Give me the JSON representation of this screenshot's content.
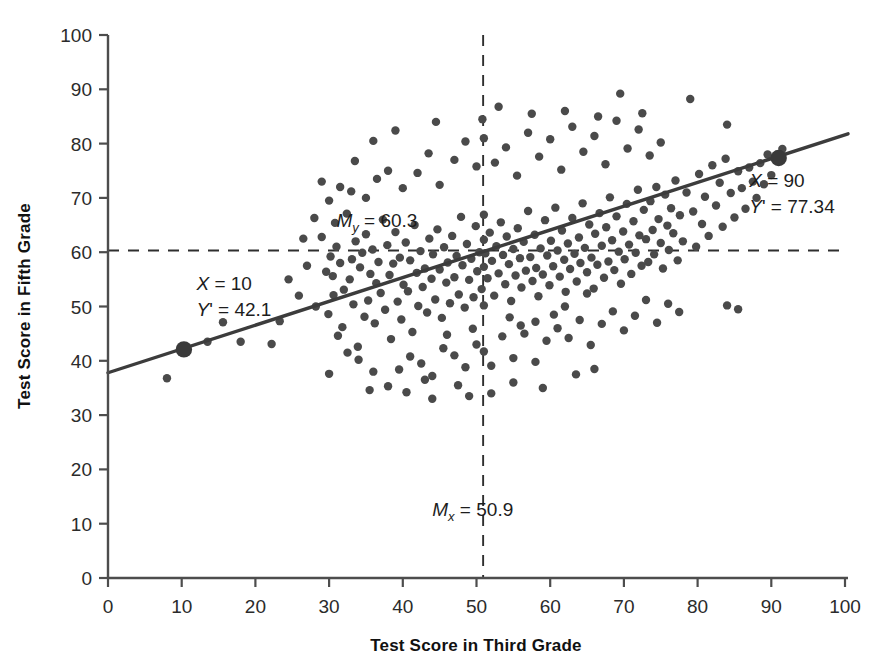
{
  "chart_data": {
    "type": "scatter",
    "title": "",
    "xlabel": "Test Score in Third Grade",
    "ylabel": "Test Score in Fifth Grade",
    "xlim": [
      0,
      100
    ],
    "ylim": [
      0,
      100
    ],
    "xticks": [
      "0",
      "10",
      "20",
      "30",
      "40",
      "50",
      "60",
      "70",
      "80",
      "90",
      "100"
    ],
    "yticks": [
      "0",
      "10",
      "20",
      "30",
      "40",
      "50",
      "60",
      "70",
      "80",
      "90",
      "100"
    ],
    "grid": false,
    "legend": "none",
    "point_color": "#4a4a4a",
    "line_color": "#3c3c3c",
    "axis_color": "#4d4d4d",
    "mean_x": 50.9,
    "mean_y": 60.3,
    "regression": {
      "x0": 0,
      "y0": 37.8,
      "x1": 100,
      "y1": 81.8,
      "slope": 0.44,
      "intercept": 37.8
    },
    "annotations": [
      {
        "name": "mean-y-label",
        "line1": "M",
        "sub": "y",
        "line1_rest": " = 60.3",
        "x": 31,
        "y": 64.6
      },
      {
        "name": "mean-x-label",
        "line1": "M",
        "sub": "x",
        "line1_rest": " = 50.9",
        "x": 44,
        "y": 11.5
      },
      {
        "name": "left-point-label",
        "line1": "X = 10",
        "line2": "Y' = 42.1",
        "x": 12,
        "y": 53
      },
      {
        "name": "right-point-label",
        "line1": "X = 90",
        "line2": "Y' = 77.34",
        "x": 87,
        "y": 72
      }
    ],
    "highlighted_points": [
      {
        "name": "point-x10",
        "x": 10.3,
        "y": 42.1,
        "label_x": "X = 10",
        "label_y": "Y' = 42.1"
      },
      {
        "name": "point-x90",
        "x": 91.0,
        "y": 77.34,
        "label_x": "X = 90",
        "label_y": "Y' = 77.34"
      }
    ],
    "points": [
      [
        8.0,
        36.8
      ],
      [
        10.3,
        42.1
      ],
      [
        13.5,
        43.5
      ],
      [
        15.6,
        47.1
      ],
      [
        18.0,
        43.5
      ],
      [
        22.2,
        43.1
      ],
      [
        23.3,
        47.3
      ],
      [
        24.5,
        55.0
      ],
      [
        25.9,
        52.0
      ],
      [
        27.0,
        57.5
      ],
      [
        28.2,
        50.0
      ],
      [
        29.0,
        62.8
      ],
      [
        29.6,
        56.4
      ],
      [
        29.9,
        48.6
      ],
      [
        30.2,
        59.2
      ],
      [
        30.5,
        55.6
      ],
      [
        30.6,
        52.1
      ],
      [
        30.8,
        65.4
      ],
      [
        31.0,
        61.0
      ],
      [
        31.2,
        44.6
      ],
      [
        31.5,
        58.0
      ],
      [
        31.8,
        46.2
      ],
      [
        32.0,
        53.1
      ],
      [
        32.4,
        67.1
      ],
      [
        32.8,
        55.0
      ],
      [
        33.1,
        58.7
      ],
      [
        33.3,
        50.4
      ],
      [
        33.6,
        62.0
      ],
      [
        33.9,
        42.6
      ],
      [
        34.2,
        57.2
      ],
      [
        34.5,
        59.9
      ],
      [
        34.8,
        48.1
      ],
      [
        35.0,
        63.3
      ],
      [
        35.3,
        51.1
      ],
      [
        35.6,
        56.0
      ],
      [
        35.9,
        60.5
      ],
      [
        36.2,
        46.9
      ],
      [
        36.4,
        54.3
      ],
      [
        36.7,
        58.2
      ],
      [
        37.0,
        52.5
      ],
      [
        37.3,
        66.0
      ],
      [
        37.6,
        49.4
      ],
      [
        37.9,
        61.3
      ],
      [
        38.2,
        55.8
      ],
      [
        38.4,
        44.0
      ],
      [
        38.7,
        57.9
      ],
      [
        39.0,
        63.7
      ],
      [
        39.3,
        50.9
      ],
      [
        39.6,
        59.0
      ],
      [
        39.8,
        47.6
      ],
      [
        40.1,
        54.0
      ],
      [
        40.4,
        61.8
      ],
      [
        40.7,
        52.8
      ],
      [
        41.0,
        58.5
      ],
      [
        41.3,
        45.3
      ],
      [
        41.6,
        65.0
      ],
      [
        41.9,
        56.2
      ],
      [
        42.1,
        50.1
      ],
      [
        42.4,
        60.2
      ],
      [
        42.7,
        53.6
      ],
      [
        43.0,
        57.0
      ],
      [
        43.3,
        48.9
      ],
      [
        43.6,
        62.5
      ],
      [
        43.9,
        55.1
      ],
      [
        44.1,
        59.6
      ],
      [
        44.4,
        51.3
      ],
      [
        44.7,
        64.2
      ],
      [
        45.0,
        56.8
      ],
      [
        45.3,
        47.9
      ],
      [
        45.6,
        60.9
      ],
      [
        45.9,
        54.4
      ],
      [
        46.1,
        58.1
      ],
      [
        46.4,
        50.6
      ],
      [
        46.7,
        63.0
      ],
      [
        47.0,
        55.4
      ],
      [
        47.3,
        59.3
      ],
      [
        47.6,
        52.2
      ],
      [
        47.9,
        66.5
      ],
      [
        48.1,
        57.6
      ],
      [
        48.4,
        49.8
      ],
      [
        48.7,
        61.5
      ],
      [
        49.0,
        54.9
      ],
      [
        49.3,
        58.8
      ],
      [
        49.6,
        51.7
      ],
      [
        49.9,
        64.8
      ],
      [
        50.1,
        56.5
      ],
      [
        50.4,
        60.0
      ],
      [
        50.7,
        53.2
      ],
      [
        51.0,
        62.3
      ],
      [
        51.0,
        57.3
      ],
      [
        51.0,
        66.9
      ],
      [
        51.0,
        50.2
      ],
      [
        51.2,
        59.8
      ],
      [
        51.5,
        55.2
      ],
      [
        51.8,
        63.6
      ],
      [
        52.1,
        58.4
      ],
      [
        52.4,
        52.0
      ],
      [
        52.7,
        61.1
      ],
      [
        53.0,
        56.1
      ],
      [
        53.3,
        65.5
      ],
      [
        53.6,
        59.5
      ],
      [
        53.9,
        54.1
      ],
      [
        54.1,
        62.9
      ],
      [
        54.4,
        57.8
      ],
      [
        54.7,
        51.0
      ],
      [
        55.0,
        60.6
      ],
      [
        55.3,
        55.7
      ],
      [
        55.6,
        64.4
      ],
      [
        55.9,
        58.9
      ],
      [
        56.1,
        53.5
      ],
      [
        56.4,
        61.9
      ],
      [
        56.7,
        56.6
      ],
      [
        57.0,
        67.6
      ],
      [
        57.3,
        59.1
      ],
      [
        57.6,
        54.7
      ],
      [
        57.9,
        63.2
      ],
      [
        58.1,
        57.1
      ],
      [
        58.4,
        51.9
      ],
      [
        58.7,
        60.7
      ],
      [
        59.0,
        55.9
      ],
      [
        59.3,
        65.9
      ],
      [
        59.6,
        59.4
      ],
      [
        59.9,
        53.9
      ],
      [
        60.1,
        62.1
      ],
      [
        60.4,
        57.4
      ],
      [
        60.7,
        68.2
      ],
      [
        61.0,
        60.3
      ],
      [
        61.3,
        55.5
      ],
      [
        61.6,
        64.0
      ],
      [
        61.9,
        58.6
      ],
      [
        62.1,
        52.7
      ],
      [
        62.4,
        61.6
      ],
      [
        62.7,
        56.9
      ],
      [
        63.0,
        66.3
      ],
      [
        63.3,
        59.7
      ],
      [
        63.6,
        54.6
      ],
      [
        63.9,
        62.7
      ],
      [
        64.1,
        58.0
      ],
      [
        64.4,
        69.0
      ],
      [
        64.7,
        60.8
      ],
      [
        65.0,
        56.3
      ],
      [
        65.3,
        65.1
      ],
      [
        65.6,
        59.0
      ],
      [
        65.9,
        53.3
      ],
      [
        66.1,
        63.4
      ],
      [
        66.4,
        57.7
      ],
      [
        66.7,
        67.2
      ],
      [
        67.0,
        61.2
      ],
      [
        67.3,
        55.3
      ],
      [
        67.6,
        64.6
      ],
      [
        67.9,
        58.3
      ],
      [
        68.1,
        70.1
      ],
      [
        68.4,
        62.2
      ],
      [
        68.7,
        56.7
      ],
      [
        69.0,
        66.6
      ],
      [
        69.3,
        60.1
      ],
      [
        69.6,
        54.2
      ],
      [
        69.9,
        63.8
      ],
      [
        70.1,
        58.7
      ],
      [
        70.4,
        68.9
      ],
      [
        70.7,
        61.4
      ],
      [
        71.0,
        56.0
      ],
      [
        71.3,
        65.7
      ],
      [
        71.6,
        59.9
      ],
      [
        71.9,
        71.5
      ],
      [
        72.1,
        63.1
      ],
      [
        72.4,
        57.5
      ],
      [
        72.7,
        67.8
      ],
      [
        73.0,
        62.4
      ],
      [
        73.3,
        58.2
      ],
      [
        73.6,
        69.4
      ],
      [
        73.9,
        64.1
      ],
      [
        74.1,
        59.6
      ],
      [
        74.4,
        72.0
      ],
      [
        74.7,
        66.1
      ],
      [
        75.0,
        61.7
      ],
      [
        75.3,
        57.0
      ],
      [
        75.6,
        70.6
      ],
      [
        75.9,
        64.9
      ],
      [
        76.1,
        60.4
      ],
      [
        76.4,
        68.1
      ],
      [
        76.7,
        63.5
      ],
      [
        77.0,
        73.2
      ],
      [
        77.3,
        58.5
      ],
      [
        77.6,
        66.8
      ],
      [
        78.0,
        62.0
      ],
      [
        78.5,
        71.0
      ],
      [
        79.0,
        88.2
      ],
      [
        79.4,
        67.5
      ],
      [
        79.8,
        61.0
      ],
      [
        80.2,
        74.4
      ],
      [
        80.6,
        65.2
      ],
      [
        81.0,
        70.2
      ],
      [
        81.5,
        63.0
      ],
      [
        82.0,
        76.0
      ],
      [
        82.5,
        68.6
      ],
      [
        83.0,
        72.8
      ],
      [
        83.4,
        64.7
      ],
      [
        83.8,
        77.2
      ],
      [
        84.0,
        83.5
      ],
      [
        84.5,
        70.9
      ],
      [
        85.0,
        66.4
      ],
      [
        85.5,
        74.9
      ],
      [
        86.0,
        71.8
      ],
      [
        86.5,
        68.0
      ],
      [
        87.0,
        75.6
      ],
      [
        87.5,
        73.0
      ],
      [
        88.0,
        70.0
      ],
      [
        88.5,
        76.4
      ],
      [
        89.0,
        72.5
      ],
      [
        89.5,
        78.0
      ],
      [
        90.0,
        74.2
      ],
      [
        91.0,
        77.34
      ],
      [
        91.5,
        79.0
      ],
      [
        30.0,
        37.6
      ],
      [
        32.5,
        41.5
      ],
      [
        34.0,
        40.2
      ],
      [
        36.0,
        38.0
      ],
      [
        38.0,
        35.3
      ],
      [
        39.5,
        38.4
      ],
      [
        41.0,
        40.8
      ],
      [
        42.5,
        39.5
      ],
      [
        44.0,
        37.2
      ],
      [
        45.5,
        42.3
      ],
      [
        47.0,
        41.0
      ],
      [
        48.5,
        38.8
      ],
      [
        50.0,
        43.0
      ],
      [
        51.0,
        41.7
      ],
      [
        52.0,
        39.1
      ],
      [
        53.5,
        44.5
      ],
      [
        55.0,
        40.5
      ],
      [
        56.5,
        45.0
      ],
      [
        58.0,
        39.8
      ],
      [
        59.5,
        43.7
      ],
      [
        61.0,
        46.0
      ],
      [
        62.5,
        44.2
      ],
      [
        64.0,
        47.5
      ],
      [
        65.5,
        42.9
      ],
      [
        67.0,
        46.8
      ],
      [
        68.5,
        49.1
      ],
      [
        70.0,
        45.6
      ],
      [
        71.5,
        48.3
      ],
      [
        73.0,
        51.2
      ],
      [
        74.5,
        47.0
      ],
      [
        76.0,
        50.5
      ],
      [
        77.5,
        49.0
      ],
      [
        84.0,
        50.2
      ],
      [
        85.5,
        49.5
      ],
      [
        26.5,
        62.5
      ],
      [
        28.0,
        66.3
      ],
      [
        30.0,
        69.5
      ],
      [
        31.5,
        72.0
      ],
      [
        33.0,
        71.2
      ],
      [
        35.0,
        70.0
      ],
      [
        36.5,
        73.5
      ],
      [
        38.0,
        75.0
      ],
      [
        40.0,
        71.8
      ],
      [
        42.0,
        74.6
      ],
      [
        43.5,
        78.2
      ],
      [
        45.0,
        72.4
      ],
      [
        47.0,
        77.0
      ],
      [
        48.5,
        80.4
      ],
      [
        50.0,
        75.8
      ],
      [
        51.0,
        81.0
      ],
      [
        52.5,
        76.5
      ],
      [
        54.0,
        79.3
      ],
      [
        55.5,
        74.1
      ],
      [
        57.0,
        82.0
      ],
      [
        58.5,
        77.6
      ],
      [
        60.0,
        80.8
      ],
      [
        61.5,
        75.2
      ],
      [
        63.0,
        83.1
      ],
      [
        64.5,
        78.5
      ],
      [
        66.0,
        81.4
      ],
      [
        67.5,
        76.2
      ],
      [
        69.0,
        84.2
      ],
      [
        70.5,
        79.1
      ],
      [
        72.0,
        82.6
      ],
      [
        73.5,
        77.8
      ],
      [
        75.0,
        80.2
      ],
      [
        69.5,
        89.2
      ],
      [
        57.5,
        85.5
      ],
      [
        62.0,
        86.0
      ],
      [
        44.5,
        84.0
      ],
      [
        50.8,
        84.5
      ],
      [
        36.0,
        80.5
      ],
      [
        33.5,
        76.8
      ],
      [
        29.0,
        73.0
      ],
      [
        39.0,
        82.4
      ],
      [
        53.0,
        86.8
      ],
      [
        66.5,
        85.0
      ],
      [
        72.5,
        85.6
      ],
      [
        44.0,
        33.0
      ],
      [
        47.5,
        35.5
      ],
      [
        52.0,
        34.0
      ],
      [
        35.5,
        34.6
      ],
      [
        43.0,
        36.5
      ],
      [
        55.0,
        36.0
      ],
      [
        59.0,
        35.0
      ],
      [
        63.5,
        37.5
      ],
      [
        49.0,
        33.5
      ],
      [
        40.5,
        34.2
      ],
      [
        66.0,
        38.5
      ],
      [
        58.0,
        47.2
      ],
      [
        60.5,
        48.5
      ],
      [
        62.0,
        50.0
      ],
      [
        65.0,
        52.4
      ],
      [
        54.5,
        48.0
      ],
      [
        56.0,
        46.5
      ],
      [
        46.0,
        44.8
      ],
      [
        49.5,
        45.9
      ]
    ]
  }
}
